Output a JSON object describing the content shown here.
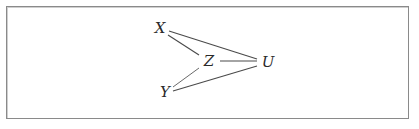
{
  "diagram": {
    "type": "undirected-graph",
    "nodes": [
      {
        "id": "X",
        "label": "X",
        "x": 160,
        "y": 28
      },
      {
        "id": "Z",
        "label": "Z",
        "x": 209,
        "y": 61
      },
      {
        "id": "U",
        "label": "U",
        "x": 268,
        "y": 62
      },
      {
        "id": "Y",
        "label": "Y",
        "x": 165,
        "y": 92
      }
    ],
    "edges": [
      {
        "from": "X",
        "to": "U"
      },
      {
        "from": "X",
        "to": "Z"
      },
      {
        "from": "Z",
        "to": "U"
      },
      {
        "from": "Z",
        "to": "Y"
      },
      {
        "from": "Y",
        "to": "U"
      }
    ],
    "colors": {
      "edge": "#4a4a4a",
      "label": "#2a2a2a",
      "border": "#8a8a8a",
      "background": "#ffffff"
    }
  }
}
